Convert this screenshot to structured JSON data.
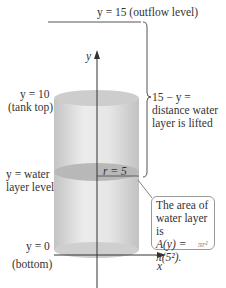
{
  "figure": {
    "top_label": "y = 15 (outflow level)",
    "tank_top_label_line1": "y = 10",
    "tank_top_label_line2": "(tank top)",
    "water_label_line1": "y = water",
    "water_label_line2": "layer level",
    "bottom_label_line1": "y = 0",
    "bottom_label_line2": "(bottom)",
    "radius_label": "r = 5",
    "y_axis_label": "y",
    "x_axis_label": "x",
    "brace_text_line1": "15 − y =",
    "brace_text_line2": "distance water",
    "brace_text_line3": "layer is lifted",
    "callout_line1": "The area of",
    "callout_line2": "water layer is",
    "callout_line3": "A(y) = π(5²).",
    "callout_underbrace": "πr²"
  },
  "colors": {
    "cylinder_fill": "#d9d9d9",
    "water_layer_fill": "#b8b8b8",
    "axis": "#333333",
    "brace": "#555555",
    "callout_border": "#999999"
  }
}
